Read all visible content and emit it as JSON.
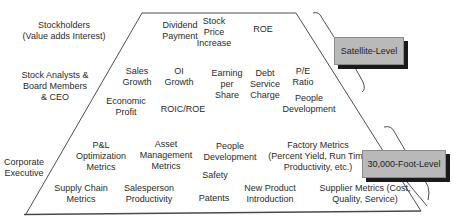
{
  "diagram": {
    "type": "trapezoid-metrics-hierarchy",
    "colors": {
      "outline": "#3a3a3a",
      "label_box_fill": "#b9b9b9",
      "label_box_shadow": "#1a1a1a",
      "text": "#2a2a2a"
    },
    "left_labels": [
      {
        "id": "stockholders",
        "text": "Stockholders\n(Value adds Interest)",
        "x": 64,
        "y": 20
      },
      {
        "id": "stock-analysts",
        "text": "Stock Analysts &\nBoard Members\n& CEO",
        "x": 55,
        "y": 70
      },
      {
        "id": "corporate-executive",
        "text": "Corporate\nExecutive",
        "x": 24,
        "y": 157
      }
    ],
    "metrics": [
      {
        "id": "dividend-payment",
        "text": "Dividend\nPayment",
        "x": 180,
        "y": 20
      },
      {
        "id": "stock-price-increase",
        "text": "Stock\nPrice\nIncrease",
        "x": 214,
        "y": 16
      },
      {
        "id": "roe",
        "text": "ROE",
        "x": 263,
        "y": 24
      },
      {
        "id": "sales-growth",
        "text": "Sales\nGrowth",
        "x": 137,
        "y": 66
      },
      {
        "id": "oi-growth",
        "text": "OI\nGrowth",
        "x": 179,
        "y": 66
      },
      {
        "id": "earning-per-share",
        "text": "Earning\nper\nShare",
        "x": 227,
        "y": 68
      },
      {
        "id": "debt-service-charge",
        "text": "Debt\nService\nCharge",
        "x": 265,
        "y": 68
      },
      {
        "id": "pe-ratio",
        "text": "P/E\nRatio",
        "x": 303,
        "y": 66
      },
      {
        "id": "economic-profit",
        "text": "Economic\nProfit",
        "x": 126,
        "y": 96
      },
      {
        "id": "roic-roe",
        "text": "ROIC/ROE",
        "x": 183,
        "y": 104
      },
      {
        "id": "people-development-top",
        "text": "People\nDevelopment",
        "x": 309,
        "y": 93
      },
      {
        "id": "pl-optimization",
        "text": "P&L\nOptimization\nMetrics",
        "x": 101,
        "y": 140
      },
      {
        "id": "asset-management",
        "text": "Asset\nManagement\nMetrics",
        "x": 166,
        "y": 139
      },
      {
        "id": "people-development-bottom",
        "text": "People\nDevelopment",
        "x": 230,
        "y": 141
      },
      {
        "id": "factory-metrics",
        "text": "Factory Metrics\n(Percent Yield, Run Time\nProductivity, etc.)",
        "x": 318,
        "y": 140
      },
      {
        "id": "safety",
        "text": "Safety",
        "x": 215,
        "y": 170
      },
      {
        "id": "supply-chain",
        "text": "Supply Chain\nMetrics",
        "x": 81,
        "y": 183
      },
      {
        "id": "salesperson-productivity",
        "text": "Salesperson\nProductivity",
        "x": 149,
        "y": 183
      },
      {
        "id": "patents",
        "text": "Patents",
        "x": 214,
        "y": 193
      },
      {
        "id": "new-product-introduction",
        "text": "New Product\nIntroduction",
        "x": 270,
        "y": 183
      },
      {
        "id": "supplier-metrics",
        "text": "Supplier Metrics (Cost,\nQuality, Service)",
        "x": 365,
        "y": 183
      }
    ],
    "level_labels": {
      "satellite": "Satellite-Level",
      "thirty_thousand": "30,000-Foot-Level"
    }
  }
}
